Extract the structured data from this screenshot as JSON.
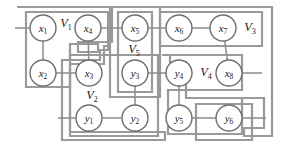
{
  "figure": {
    "type": "graph-partition-diagram",
    "width": 287,
    "height": 146,
    "background_color": "#ffffff",
    "node_stroke_color": "#6f6f6f",
    "edge_color": "#8d8d8d",
    "box_color": "#9a9a9a",
    "text_color": "#1a1a1a"
  },
  "nodes": [
    {
      "id": "x1",
      "base": "x",
      "sub": "1",
      "cx": 43,
      "cy": 28,
      "r": 13
    },
    {
      "id": "x4",
      "base": "x",
      "sub": "4",
      "cx": 88,
      "cy": 28,
      "r": 13
    },
    {
      "id": "x5",
      "base": "x",
      "sub": "5",
      "cx": 135,
      "cy": 28,
      "r": 13
    },
    {
      "id": "x6",
      "base": "x",
      "sub": "6",
      "cx": 179,
      "cy": 28,
      "r": 13
    },
    {
      "id": "x7",
      "base": "x",
      "sub": "7",
      "cx": 223,
      "cy": 28,
      "r": 13
    },
    {
      "id": "x2",
      "base": "x",
      "sub": "2",
      "cx": 43,
      "cy": 73,
      "r": 13
    },
    {
      "id": "x3",
      "base": "x",
      "sub": "3",
      "cx": 89,
      "cy": 73,
      "r": 13
    },
    {
      "id": "y3",
      "base": "y",
      "sub": "3",
      "cx": 135,
      "cy": 73,
      "r": 13
    },
    {
      "id": "y4",
      "base": "y",
      "sub": "4",
      "cx": 179,
      "cy": 73,
      "r": 13
    },
    {
      "id": "x8",
      "base": "x",
      "sub": "8",
      "cx": 229,
      "cy": 73,
      "r": 13
    },
    {
      "id": "y1",
      "base": "y",
      "sub": "1",
      "cx": 89,
      "cy": 118,
      "r": 13
    },
    {
      "id": "y2",
      "base": "y",
      "sub": "2",
      "cx": 135,
      "cy": 118,
      "r": 13
    },
    {
      "id": "y5",
      "base": "y",
      "sub": "5",
      "cx": 179,
      "cy": 118,
      "r": 13
    },
    {
      "id": "y6",
      "base": "y",
      "sub": "6",
      "cx": 229,
      "cy": 118,
      "r": 13
    }
  ],
  "region_labels": [
    {
      "id": "V1",
      "base": "V",
      "sub": "1",
      "x": 66,
      "y": 24
    },
    {
      "id": "V5",
      "base": "V",
      "sub": "5",
      "x": 134,
      "y": 50
    },
    {
      "id": "V3",
      "base": "V",
      "sub": "3",
      "x": 250,
      "y": 28
    },
    {
      "id": "V4",
      "base": "V",
      "sub": "4",
      "x": 206,
      "y": 73
    },
    {
      "id": "V2",
      "base": "V",
      "sub": "2",
      "x": 92,
      "y": 96
    }
  ],
  "region_boxes": [
    {
      "id": "box-V1",
      "x": 26,
      "y": 12,
      "w": 82,
      "h": 75
    },
    {
      "id": "box-V1-out",
      "x": 17,
      "y": 7,
      "w": 272,
      "h": 0
    },
    {
      "id": "box-V5",
      "x": 116,
      "y": 12,
      "w": 38,
      "h": 80
    },
    {
      "id": "box-V5-out",
      "x": 110,
      "y": 7,
      "w": 50,
      "h": 90
    },
    {
      "id": "box-V3",
      "x": 160,
      "y": 12,
      "w": 102,
      "h": 34
    },
    {
      "id": "box-V2",
      "x": 70,
      "y": 55,
      "w": 88,
      "h": 81
    },
    {
      "id": "box-V2-out",
      "x": 62,
      "y": 48,
      "w": 103,
      "h": 92
    },
    {
      "id": "box-V4",
      "x": 162,
      "y": 55,
      "w": 80,
      "h": 81
    },
    {
      "id": "box-V4-out",
      "x": 168,
      "y": 62,
      "w": 116,
      "h": 72
    }
  ],
  "edges": [
    {
      "from": "x1",
      "to": "x2"
    },
    {
      "from": "x2",
      "to": "x3"
    },
    {
      "from": "x4",
      "to": "x3"
    },
    {
      "from": "x4",
      "to": "x5"
    },
    {
      "from": "x5",
      "to": "x6"
    },
    {
      "from": "x6",
      "to": "x7"
    },
    {
      "from": "x7",
      "to": "x8"
    },
    {
      "from": "y3",
      "to": "y2"
    },
    {
      "from": "y3",
      "to": "y4"
    },
    {
      "from": "y1",
      "to": "y2"
    },
    {
      "from": "y4",
      "to": "y5"
    },
    {
      "from": "y5",
      "to": "y6"
    }
  ],
  "stubs": [
    {
      "id": "stub-x1-left",
      "x1": 15,
      "y1": 28,
      "x2": 30,
      "y2": 28
    },
    {
      "id": "stub-y1-left",
      "x1": 58,
      "y1": 118,
      "x2": 76,
      "y2": 118
    },
    {
      "id": "stub-x8-right",
      "x1": 242,
      "y1": 73,
      "x2": 262,
      "y2": 73
    },
    {
      "id": "stub-y6-right",
      "x1": 242,
      "y1": 118,
      "x2": 266,
      "y2": 118
    }
  ]
}
